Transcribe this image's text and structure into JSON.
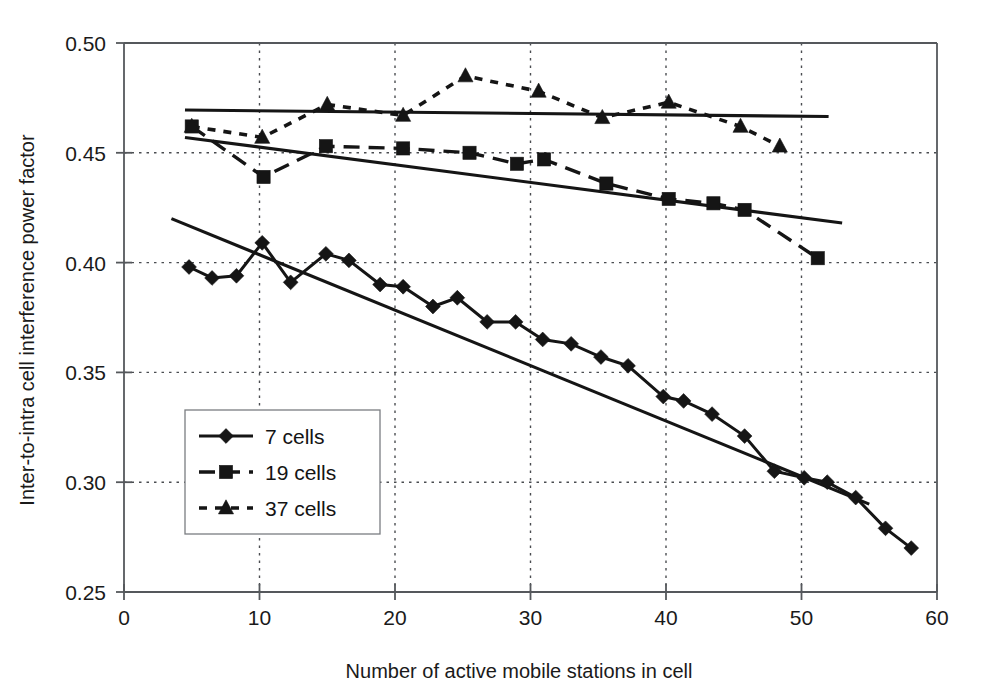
{
  "chart_data": {
    "type": "line",
    "title": "",
    "xlabel": "Number of active mobile stations in cell",
    "ylabel": "Inter-to-intra cell interference power factor",
    "xlim": [
      0,
      60
    ],
    "ylim": [
      0.25,
      0.5
    ],
    "xticks": [
      0,
      10,
      20,
      30,
      40,
      50,
      60
    ],
    "xtick_labels": [
      "0",
      "10",
      "20",
      "30",
      "40",
      "50",
      "60"
    ],
    "yticks": [
      0.25,
      0.3,
      0.35,
      0.4,
      0.45,
      0.5
    ],
    "ytick_labels": [
      "0.25",
      "0.30",
      "0.35",
      "0.40",
      "0.45",
      "0.50"
    ],
    "grid": "dotted-both-axes",
    "legend_position": "lower-left-inside",
    "series": [
      {
        "name": "7 cells",
        "marker": "diamond",
        "linestyle": "solid",
        "x": [
          4.8,
          6.5,
          8.3,
          10.2,
          12.3,
          14.9,
          16.6,
          18.9,
          20.6,
          22.8,
          24.6,
          26.8,
          28.9,
          30.9,
          33.0,
          35.2,
          37.2,
          39.8,
          41.3,
          43.4,
          45.8,
          48.0,
          50.2,
          51.9,
          54.0,
          56.2,
          58.1
        ],
        "y": [
          0.398,
          0.393,
          0.394,
          0.409,
          0.391,
          0.404,
          0.401,
          0.39,
          0.389,
          0.38,
          0.384,
          0.373,
          0.373,
          0.365,
          0.363,
          0.357,
          0.353,
          0.339,
          0.337,
          0.331,
          0.321,
          0.305,
          0.302,
          0.3,
          0.293,
          0.279,
          0.27
        ],
        "trendline": {
          "x": [
            3.5,
            55.0
          ],
          "y": [
            0.42,
            0.29
          ]
        }
      },
      {
        "name": "19 cells",
        "marker": "square",
        "linestyle": "dashed",
        "x": [
          5.0,
          10.3,
          14.9,
          20.6,
          25.5,
          29.0,
          31.0,
          35.6,
          40.2,
          43.5,
          45.8,
          51.2
        ],
        "y": [
          0.462,
          0.439,
          0.453,
          0.452,
          0.45,
          0.445,
          0.447,
          0.436,
          0.429,
          0.427,
          0.424,
          0.402
        ],
        "trendline": {
          "x": [
            4.5,
            53.0
          ],
          "y": [
            0.457,
            0.418
          ]
        }
      },
      {
        "name": "37 cells",
        "marker": "triangle",
        "linestyle": "dotted",
        "x": [
          5.0,
          10.2,
          15.0,
          20.6,
          25.2,
          30.6,
          35.3,
          40.2,
          45.5,
          48.4
        ],
        "y": [
          0.462,
          0.457,
          0.472,
          0.467,
          0.485,
          0.478,
          0.466,
          0.473,
          0.462,
          0.453
        ],
        "trendline": {
          "x": [
            4.5,
            52.0
          ],
          "y": [
            0.4695,
            0.4665
          ]
        }
      }
    ]
  },
  "legend": {
    "items": [
      {
        "label": "7 cells"
      },
      {
        "label": "19 cells"
      },
      {
        "label": "37 cells"
      }
    ]
  },
  "colors": {
    "ink": "#151515",
    "axis": "#55585c",
    "background": "#ffffff"
  }
}
